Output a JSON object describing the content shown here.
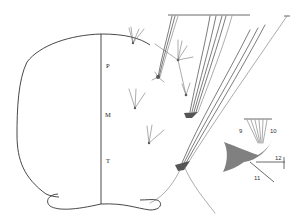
{
  "figure": {
    "type": "morphological line drawing",
    "segment_labels": [
      "P",
      "M",
      "T"
    ],
    "inset": {
      "labels": [
        "9",
        "10",
        "11",
        "12"
      ]
    },
    "colors": {
      "ink": "#333333",
      "background": "#ffffff",
      "stipple": "#555555"
    }
  }
}
